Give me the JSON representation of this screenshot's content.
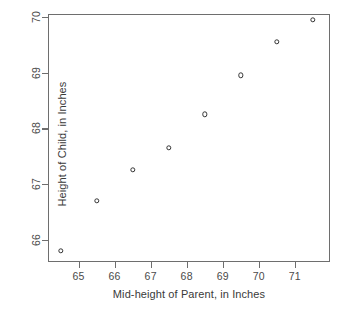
{
  "chart_data": {
    "type": "scatter",
    "title": "",
    "xlabel": "Mid-height of Parent, in Inches",
    "ylabel": "Height of Child, in Inches",
    "xlim": [
      64.15,
      71.98
    ],
    "ylim": [
      65.6,
      70.05
    ],
    "xticks": [
      65,
      66,
      67,
      68,
      69,
      70,
      71
    ],
    "yticks": [
      66,
      67,
      68,
      69,
      70
    ],
    "xticklabels": [
      "65",
      "66",
      "67",
      "68",
      "69",
      "70",
      "71"
    ],
    "yticklabels": [
      "66",
      "67",
      "68",
      "69",
      "70"
    ],
    "grid": false,
    "legend": null,
    "marker": "open-circle",
    "marker_color": "#333333",
    "frame_color": "#6e6e6e",
    "background": "#ffffff",
    "x": [
      64.5,
      65.5,
      66.5,
      67.5,
      68.5,
      69.5,
      70.5,
      71.5
    ],
    "y": [
      65.8,
      66.7,
      67.25,
      67.65,
      68.25,
      68.95,
      69.55,
      69.95
    ],
    "points": [
      {
        "x": 64.5,
        "y": 65.8
      },
      {
        "x": 65.5,
        "y": 66.7
      },
      {
        "x": 66.5,
        "y": 67.25
      },
      {
        "x": 67.5,
        "y": 67.65
      },
      {
        "x": 68.5,
        "y": 68.25
      },
      {
        "x": 69.5,
        "y": 68.95
      },
      {
        "x": 70.5,
        "y": 69.55
      },
      {
        "x": 71.5,
        "y": 69.95
      }
    ]
  }
}
